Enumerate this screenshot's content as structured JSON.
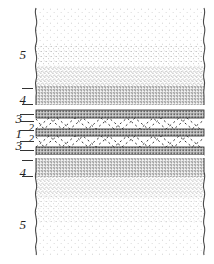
{
  "figure": {
    "type": "cross-section-diagram",
    "title": "",
    "background_color": "#ffffff",
    "ink_color": "#2b2b2b"
  },
  "labels": [
    {
      "id": "label-5-top",
      "text": "5",
      "size": "big",
      "x": 12,
      "y": 48,
      "ticks": []
    },
    {
      "id": "label-4-top",
      "text": "4",
      "size": "big",
      "x": 12,
      "y": 93,
      "ticks": [
        {
          "x": 22,
          "y": 88,
          "w": 11
        },
        {
          "x": 22,
          "y": 104,
          "w": 11
        }
      ]
    },
    {
      "id": "label-3-upper",
      "text": "3",
      "size": "big",
      "x": 8,
      "y": 112,
      "ticks": [
        {
          "x": 20,
          "y": 114,
          "w": 14
        }
      ]
    },
    {
      "id": "label-2-upper",
      "text": "2",
      "size": "sm",
      "x": 20,
      "y": 122,
      "ticks": [
        {
          "x": 20,
          "y": 121,
          "w": 14
        },
        {
          "x": 20,
          "y": 130,
          "w": 14
        }
      ]
    },
    {
      "id": "label-1-middle",
      "text": "1",
      "size": "big",
      "x": 8,
      "y": 127,
      "ticks": []
    },
    {
      "id": "label-2-lower",
      "text": "2",
      "size": "sm",
      "x": 20,
      "y": 133,
      "ticks": [
        {
          "x": 20,
          "y": 141,
          "w": 14
        }
      ]
    },
    {
      "id": "label-3-lower",
      "text": "3",
      "size": "big",
      "x": 8,
      "y": 139,
      "ticks": [
        {
          "x": 20,
          "y": 150,
          "w": 14
        }
      ]
    },
    {
      "id": "label-4-bottom",
      "text": "4",
      "size": "big",
      "x": 12,
      "y": 166,
      "ticks": [
        {
          "x": 22,
          "y": 160,
          "w": 11
        },
        {
          "x": 22,
          "y": 176,
          "w": 11
        }
      ]
    },
    {
      "id": "label-5-bottom",
      "text": "5",
      "size": "big",
      "x": 12,
      "y": 218,
      "ticks": []
    }
  ],
  "layers": [
    {
      "id": "layer-5-top",
      "number": "5",
      "kind": "stipple-gradient",
      "y": 8,
      "height": 78,
      "tone_top": 0.04,
      "tone_bottom": 0.22
    },
    {
      "id": "layer-4-top",
      "number": "4",
      "kind": "stipple-dense",
      "y": 86,
      "height": 19,
      "tone_top": 0.46,
      "tone_bottom": 0.4
    },
    {
      "id": "gap-upper",
      "number": "",
      "kind": "white-gap",
      "y": 105,
      "height": 5,
      "tone_top": 0.0,
      "tone_bottom": 0.0
    },
    {
      "id": "layer-3-upper",
      "number": "3",
      "kind": "solid-band",
      "y": 110,
      "height": 8,
      "tone_top": 0.42,
      "tone_bottom": 0.42
    },
    {
      "id": "layer-2-upper",
      "number": "2",
      "kind": "zigzag-dashed",
      "y": 118,
      "height": 11,
      "tone_top": 0.0,
      "tone_bottom": 0.0
    },
    {
      "id": "layer-1-middle",
      "number": "1",
      "kind": "solid-band",
      "y": 129,
      "height": 7,
      "tone_top": 0.46,
      "tone_bottom": 0.46
    },
    {
      "id": "layer-2-lower",
      "number": "2",
      "kind": "zigzag-dashed",
      "y": 136,
      "height": 11,
      "tone_top": 0.0,
      "tone_bottom": 0.0
    },
    {
      "id": "layer-3-lower",
      "number": "3",
      "kind": "solid-band",
      "y": 147,
      "height": 8,
      "tone_top": 0.42,
      "tone_bottom": 0.42
    },
    {
      "id": "gap-lower",
      "number": "",
      "kind": "white-gap",
      "y": 155,
      "height": 3,
      "tone_top": 0.0,
      "tone_bottom": 0.0
    },
    {
      "id": "layer-4-bottom",
      "number": "4",
      "kind": "stipple-dense",
      "y": 158,
      "height": 19,
      "tone_top": 0.44,
      "tone_bottom": 0.38
    },
    {
      "id": "layer-5-bottom",
      "number": "5",
      "kind": "stipple-gradient",
      "y": 177,
      "height": 78,
      "tone_top": 0.22,
      "tone_bottom": 0.04
    }
  ],
  "edges": {
    "left_edge_label": "torn-wavy-edge-left",
    "right_edge_label": "torn-wavy-edge-right",
    "left_x": 36,
    "right_x": 204,
    "style": "wavy-break-line"
  },
  "zigzag": {
    "pattern": "dashed-triangular-zigzag",
    "repeat_width": 26,
    "dash": "2 3",
    "color": "#3a3a3a"
  }
}
